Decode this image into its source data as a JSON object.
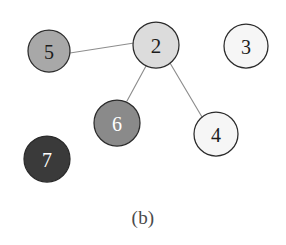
{
  "figure": {
    "caption": "(b)",
    "caption_y": 207,
    "background": "#ffffff",
    "width": 286,
    "height": 245
  },
  "chart_data": {
    "type": "diagram",
    "subtype": "node-link-graph",
    "title": "",
    "caption": "(b)",
    "directed": false,
    "node_count": 6,
    "edge_count": 3,
    "nodes": [
      {
        "id": "5",
        "label": "5",
        "cx": 49,
        "cy": 51,
        "r": 21,
        "fill": "#a8a8a8",
        "stroke": "#2b2b2b",
        "text_color": "#1c1c1c",
        "font_size": 20
      },
      {
        "id": "2",
        "label": "2",
        "cx": 156,
        "cy": 45,
        "r": 23,
        "fill": "#dcdcdc",
        "stroke": "#2b2b2b",
        "text_color": "#1c1c1c",
        "font_size": 21
      },
      {
        "id": "3",
        "label": "3",
        "cx": 246,
        "cy": 46,
        "r": 22,
        "fill": "#f6f6f6",
        "stroke": "#2b2b2b",
        "text_color": "#1c1c1c",
        "font_size": 20
      },
      {
        "id": "6",
        "label": "6",
        "cx": 117,
        "cy": 123,
        "r": 23,
        "fill": "#8a8a8a",
        "stroke": "#2b2b2b",
        "text_color": "#ffffff",
        "font_size": 20
      },
      {
        "id": "4",
        "label": "4",
        "cx": 216,
        "cy": 134,
        "r": 22,
        "fill": "#f6f6f6",
        "stroke": "#2b2b2b",
        "text_color": "#1c1c1c",
        "font_size": 20
      },
      {
        "id": "7",
        "label": "7",
        "cx": 47,
        "cy": 159,
        "r": 23,
        "fill": "#3a3a3a",
        "stroke": "#2b2b2b",
        "text_color": "#ffffff",
        "font_size": 20
      }
    ],
    "edges": [
      {
        "source": "5",
        "target": "2",
        "x1": 70,
        "y1": 53,
        "x2": 134,
        "y2": 43
      },
      {
        "source": "2",
        "target": "6",
        "x1": 146,
        "y1": 66,
        "x2": 127,
        "y2": 101
      },
      {
        "source": "2",
        "target": "4",
        "x1": 170,
        "y1": 63,
        "x2": 202,
        "y2": 117
      }
    ],
    "isolated_nodes": [
      "3",
      "7"
    ],
    "legend": [],
    "annotations": []
  }
}
